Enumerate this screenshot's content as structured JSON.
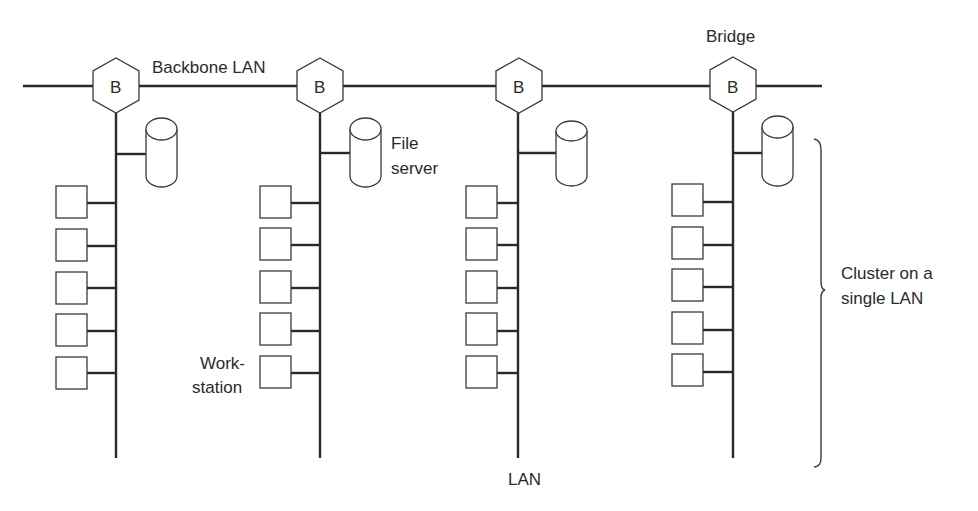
{
  "diagram": {
    "type": "network-topology",
    "labels": {
      "backbone": "Backbone LAN",
      "bridge": "Bridge",
      "file_server_line1": "File",
      "file_server_line2": "server",
      "workstation_line1": "Work-",
      "workstation_line2": "station",
      "lan": "LAN",
      "cluster_line1": "Cluster on a",
      "cluster_line2": "single LAN"
    },
    "bridge_symbol": "B",
    "backbone": {
      "y": 86,
      "x_start": 23,
      "x_end": 822
    },
    "clusters": [
      {
        "id": "cluster-1",
        "bridge_label": "B",
        "bus_x": 116,
        "bus_bottom": 458,
        "file_server": {
          "x": 146,
          "y": 117
        },
        "workstation_count": 5
      },
      {
        "id": "cluster-2",
        "bridge_label": "B",
        "bus_x": 320,
        "bus_bottom": 458,
        "file_server": {
          "x": 350,
          "y": 117
        },
        "workstation_count": 5
      },
      {
        "id": "cluster-3",
        "bridge_label": "B",
        "bus_x": 518,
        "bus_bottom": 458,
        "file_server": {
          "x": 556,
          "y": 120
        },
        "workstation_count": 5
      },
      {
        "id": "cluster-4",
        "bridge_label": "B",
        "bus_x": 733,
        "bus_bottom": 458,
        "file_server": {
          "x": 762,
          "y": 117
        },
        "workstation_count": 5
      }
    ],
    "workstation_rows_y": [
      186,
      228,
      271,
      314,
      357
    ],
    "colors": {
      "stroke": "#2a2a2a",
      "background": "#ffffff"
    }
  }
}
